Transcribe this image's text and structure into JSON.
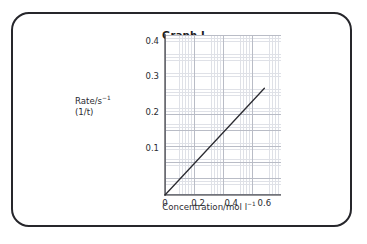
{
  "figure": {
    "title": "Graph I",
    "border_color": "#26262b",
    "background_color": "#ffffff"
  },
  "chart_data": {
    "type": "line",
    "title": "Graph I",
    "xlabel_prefix": "Concentration/mol  l",
    "xlabel_exponent": "−1",
    "ylabel_line1_prefix": "Rate/s",
    "ylabel_line1_exponent": "−1",
    "ylabel_line2": "(1/t)",
    "xlim": [
      0,
      0.7
    ],
    "ylim": [
      0,
      0.45
    ],
    "xticks": [
      "0",
      "0.2",
      "0.4",
      "0.6"
    ],
    "xtick_values": [
      0,
      0.2,
      0.4,
      0.6
    ],
    "yticks": [
      "0.1",
      "0.2",
      "0.3",
      "0.4"
    ],
    "ytick_values": [
      0.1,
      0.2,
      0.3,
      0.4
    ],
    "y_origin_label": "0",
    "grid": true,
    "grid_major_color": "#b9bcc6",
    "grid_minor_color": "#dfe1e7",
    "legend": null,
    "series": [
      {
        "name": "Rate vs concentration",
        "color": "#2b2b31",
        "x": [
          0,
          0.6
        ],
        "y": [
          0,
          0.3
        ],
        "slope": 0.5,
        "intercept": 0
      }
    ]
  }
}
